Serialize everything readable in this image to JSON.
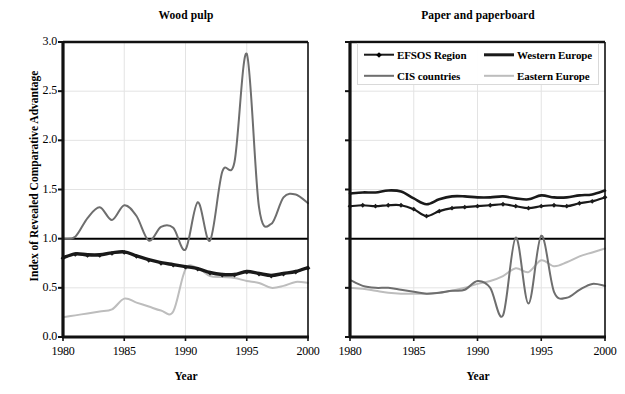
{
  "figure": {
    "ylabel": "Index of Revealed Comparative Advantage",
    "xlabel": "Year"
  },
  "legend": {
    "position": "top-right-inside-right-panel",
    "items": [
      {
        "label": "EFSOS Region",
        "color": "#1a1a1a",
        "width": 2.6,
        "marker": "diamond",
        "name": "legend-efsos-region"
      },
      {
        "label": "Western Europe",
        "color": "#1a1a1a",
        "width": 3.2,
        "marker": "none",
        "name": "legend-western-europe"
      },
      {
        "label": "CIS countries",
        "color": "#6e6e6e",
        "width": 2.2,
        "marker": "none",
        "name": "legend-cis-countries"
      },
      {
        "label": "Eastern Europe",
        "color": "#bdbdbd",
        "width": 2.2,
        "marker": "none",
        "name": "legend-eastern-europe"
      }
    ]
  },
  "top_caption": "",
  "chart_data": [
    {
      "type": "line",
      "title": "Wood pulp",
      "xlabel": "Year",
      "ylabel": "Index of Revealed Comparative Advantage",
      "xlim": [
        1980,
        2000
      ],
      "ylim": [
        0.0,
        3.0
      ],
      "yticks": [
        0.0,
        0.5,
        1.0,
        1.5,
        2.0,
        2.5,
        3.0
      ],
      "ytick_labels": [
        "0.0",
        "0.5",
        "1.0",
        "1.5",
        "2.0",
        "2.5",
        "3.0"
      ],
      "xticks": [
        1980,
        1985,
        1990,
        1995,
        2000
      ],
      "xtick_labels": [
        "1980",
        "1985",
        "1990",
        "1995",
        "2000"
      ],
      "grid": true,
      "reference_line": 1.0,
      "x": [
        1980,
        1981,
        1982,
        1983,
        1984,
        1985,
        1986,
        1987,
        1988,
        1989,
        1990,
        1991,
        1992,
        1993,
        1994,
        1995,
        1996,
        1997,
        1998,
        1999,
        2000
      ],
      "series": [
        {
          "name": "EFSOS Region",
          "color": "#1a1a1a",
          "marker": "diamond",
          "values": [
            0.8,
            0.84,
            0.83,
            0.83,
            0.85,
            0.86,
            0.82,
            0.78,
            0.75,
            0.73,
            0.71,
            0.69,
            0.65,
            0.63,
            0.63,
            0.66,
            0.64,
            0.62,
            0.64,
            0.66,
            0.7
          ]
        },
        {
          "name": "Western Europe",
          "color": "#1a1a1a",
          "marker": "none",
          "values": [
            0.81,
            0.85,
            0.84,
            0.84,
            0.86,
            0.87,
            0.83,
            0.79,
            0.76,
            0.74,
            0.72,
            0.7,
            0.66,
            0.64,
            0.64,
            0.67,
            0.65,
            0.63,
            0.65,
            0.67,
            0.71
          ]
        },
        {
          "name": "CIS countries",
          "color": "#6e6e6e",
          "marker": "none",
          "values": [
            1.0,
            1.02,
            1.21,
            1.32,
            1.19,
            1.34,
            1.23,
            0.98,
            1.12,
            1.11,
            0.89,
            1.37,
            0.98,
            1.68,
            1.78,
            2.88,
            1.32,
            1.15,
            1.42,
            1.45,
            1.36
          ]
        },
        {
          "name": "Eastern Europe",
          "color": "#bdbdbd",
          "marker": "none",
          "values": [
            0.2,
            0.22,
            0.24,
            0.26,
            0.28,
            0.39,
            0.35,
            0.31,
            0.27,
            0.26,
            0.69,
            0.7,
            0.62,
            0.61,
            0.6,
            0.57,
            0.55,
            0.5,
            0.52,
            0.56,
            0.55
          ]
        }
      ]
    },
    {
      "type": "line",
      "title": "Paper and paperboard",
      "xlabel": "Year",
      "ylabel": "Index of Revealed Comparative Advantage",
      "xlim": [
        1980,
        2000
      ],
      "ylim": [
        0.0,
        3.0
      ],
      "yticks": [
        0.0,
        0.5,
        1.0,
        1.5,
        2.0,
        2.5,
        3.0
      ],
      "ytick_labels": [
        "0.0",
        "0.5",
        "1.0",
        "1.5",
        "2.0",
        "2.5",
        "3.0"
      ],
      "xticks": [
        1980,
        1985,
        1990,
        1995,
        2000
      ],
      "xtick_labels": [
        "1980",
        "1985",
        "1990",
        "1995",
        "2000"
      ],
      "grid": true,
      "reference_line": 1.0,
      "x": [
        1980,
        1981,
        1982,
        1983,
        1984,
        1985,
        1986,
        1987,
        1988,
        1989,
        1990,
        1991,
        1992,
        1993,
        1994,
        1995,
        1996,
        1997,
        1998,
        1999,
        2000
      ],
      "series": [
        {
          "name": "EFSOS Region",
          "color": "#1a1a1a",
          "marker": "diamond",
          "values": [
            1.33,
            1.34,
            1.33,
            1.34,
            1.34,
            1.3,
            1.23,
            1.28,
            1.31,
            1.32,
            1.33,
            1.34,
            1.35,
            1.33,
            1.31,
            1.33,
            1.34,
            1.33,
            1.36,
            1.38,
            1.42
          ]
        },
        {
          "name": "Western Europe",
          "color": "#1a1a1a",
          "marker": "none",
          "values": [
            1.46,
            1.47,
            1.47,
            1.49,
            1.48,
            1.41,
            1.35,
            1.4,
            1.43,
            1.43,
            1.42,
            1.42,
            1.43,
            1.41,
            1.4,
            1.44,
            1.42,
            1.42,
            1.44,
            1.45,
            1.49
          ]
        },
        {
          "name": "CIS countries",
          "color": "#6e6e6e",
          "marker": "none",
          "values": [
            0.58,
            0.52,
            0.5,
            0.5,
            0.48,
            0.46,
            0.44,
            0.45,
            0.47,
            0.48,
            0.57,
            0.5,
            0.22,
            1.01,
            0.34,
            1.03,
            0.46,
            0.4,
            0.48,
            0.54,
            0.52
          ]
        },
        {
          "name": "Eastern Europe",
          "color": "#bdbdbd",
          "marker": "none",
          "values": [
            0.5,
            0.49,
            0.47,
            0.45,
            0.44,
            0.44,
            0.44,
            0.45,
            0.47,
            0.5,
            0.54,
            0.57,
            0.62,
            0.7,
            0.66,
            0.78,
            0.72,
            0.76,
            0.82,
            0.86,
            0.9
          ]
        }
      ]
    }
  ]
}
